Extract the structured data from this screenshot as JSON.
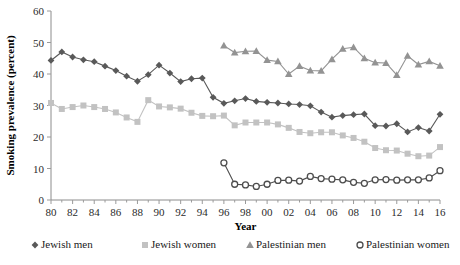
{
  "chart_data": {
    "type": "line",
    "title": "",
    "xlabel": "Year",
    "ylabel": "Smoking prevalence (percent)",
    "xlim": [
      1980,
      2016
    ],
    "ylim": [
      0,
      60
    ],
    "ytick_step": 10,
    "yticks": [
      "0",
      "10",
      "20",
      "30",
      "40",
      "50",
      "60"
    ],
    "xticks": [
      "80",
      "82",
      "84",
      "86",
      "88",
      "90",
      "92",
      "94",
      "96",
      "98",
      "00",
      "02",
      "04",
      "06",
      "08",
      "10",
      "12",
      "14",
      "16"
    ],
    "xtick_years": [
      1980,
      1982,
      1984,
      1986,
      1988,
      1990,
      1992,
      1994,
      1996,
      1998,
      2000,
      2002,
      2004,
      2006,
      2008,
      2010,
      2012,
      2014,
      2016
    ],
    "grid": false,
    "legend_position": "bottom",
    "series": [
      {
        "name": "Jewish men",
        "marker": "diamond",
        "color": "#595959",
        "x": [
          1980,
          1981,
          1982,
          1983,
          1984,
          1985,
          1986,
          1987,
          1988,
          1989,
          1990,
          1991,
          1992,
          1993,
          1994,
          1995,
          1996,
          1997,
          1998,
          1999,
          2000,
          2001,
          2002,
          2003,
          2004,
          2005,
          2006,
          2007,
          2008,
          2009,
          2010,
          2011,
          2012,
          2013,
          2014,
          2015,
          2016
        ],
        "values": [
          44.3,
          47.0,
          45.4,
          44.5,
          43.9,
          42.5,
          41.1,
          39.3,
          37.7,
          39.8,
          42.8,
          40.3,
          37.6,
          38.5,
          38.7,
          32.6,
          30.7,
          31.5,
          32.2,
          31.3,
          31.0,
          30.8,
          30.5,
          30.3,
          29.9,
          27.9,
          26.3,
          26.8,
          27.1,
          27.3,
          23.6,
          23.5,
          24.2,
          21.6,
          23.0,
          21.9,
          27.2
        ]
      },
      {
        "name": "Jewish women",
        "marker": "square",
        "color": "#c2c2c2",
        "x": [
          1980,
          1981,
          1982,
          1983,
          1984,
          1985,
          1986,
          1987,
          1988,
          1989,
          1990,
          1991,
          1992,
          1993,
          1994,
          1995,
          1996,
          1997,
          1998,
          1999,
          2000,
          2001,
          2002,
          2003,
          2004,
          2005,
          2006,
          2007,
          2008,
          2009,
          2010,
          2011,
          2012,
          2013,
          2014,
          2015,
          2016
        ],
        "values": [
          30.8,
          28.9,
          29.5,
          30.0,
          29.5,
          28.9,
          27.8,
          26.2,
          24.8,
          31.7,
          29.7,
          29.4,
          29.0,
          27.7,
          26.7,
          26.6,
          26.8,
          23.7,
          24.6,
          24.6,
          24.6,
          24.0,
          22.9,
          21.6,
          21.2,
          21.5,
          21.5,
          20.5,
          19.7,
          18.5,
          16.5,
          15.8,
          15.7,
          14.7,
          13.9,
          14.1,
          16.8
        ]
      },
      {
        "name": "Palestinian men",
        "marker": "triangle",
        "color": "#939393",
        "x": [
          1996,
          1997,
          1998,
          1999,
          2000,
          2001,
          2002,
          2003,
          2004,
          2005,
          2006,
          2007,
          2008,
          2009,
          2010,
          2011,
          2012,
          2013,
          2014,
          2015,
          2016
        ],
        "values": [
          49.0,
          46.8,
          47.2,
          47.3,
          44.4,
          44.0,
          40.0,
          42.5,
          41.1,
          41.0,
          44.7,
          48.0,
          48.5,
          45.0,
          43.6,
          43.5,
          39.7,
          45.8,
          43.0,
          44.0,
          42.6
        ]
      },
      {
        "name": "Palestinian women",
        "marker": "circle",
        "color": "#4d4d4d",
        "x": [
          1996,
          1997,
          1998,
          1999,
          2000,
          2001,
          2002,
          2003,
          2004,
          2005,
          2006,
          2007,
          2008,
          2009,
          2010,
          2011,
          2012,
          2013,
          2014,
          2015,
          2016
        ],
        "values": [
          11.8,
          5.0,
          4.8,
          4.3,
          5.0,
          6.2,
          6.3,
          6.0,
          7.5,
          6.8,
          6.6,
          6.4,
          5.6,
          5.3,
          6.4,
          6.5,
          6.3,
          6.4,
          6.4,
          7.0,
          9.3
        ]
      }
    ]
  },
  "legend": {
    "items": [
      {
        "label": "Jewish men"
      },
      {
        "label": "Jewish women"
      },
      {
        "label": "Palestinian men"
      },
      {
        "label": "Palestinian women"
      }
    ]
  }
}
